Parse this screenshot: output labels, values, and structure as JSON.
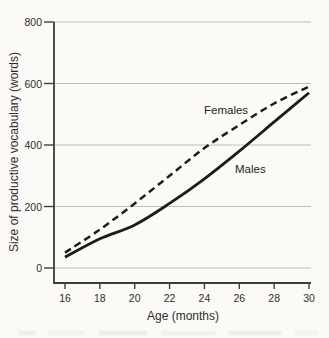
{
  "chart_data": {
    "type": "line",
    "x": [
      16,
      18,
      20,
      22,
      24,
      26,
      28,
      30
    ],
    "series": [
      {
        "name": "Females",
        "line_style": "dashed",
        "values": [
          50,
          125,
          210,
          300,
          390,
          465,
          535,
          590
        ]
      },
      {
        "name": "Males",
        "line_style": "solid",
        "values": [
          35,
          95,
          140,
          210,
          290,
          380,
          475,
          570
        ]
      }
    ],
    "xlabel": "Age (months)",
    "ylabel": "Size of productive vocabulary (words)",
    "xlim": [
      16,
      30
    ],
    "ylim": [
      0,
      800
    ],
    "x_ticks": [
      16,
      18,
      20,
      22,
      24,
      26,
      28,
      30
    ],
    "y_ticks": [
      0,
      200,
      400,
      600,
      800
    ],
    "grid": "horizontal gridlines at y ticks",
    "legend": "inline curve labels"
  },
  "colors": {
    "curve": "#1b1b1b",
    "axis": "#3d3d3d",
    "grid": "#b6b5b1",
    "text": "#2e2d2b",
    "background": "#fbfaf7"
  }
}
